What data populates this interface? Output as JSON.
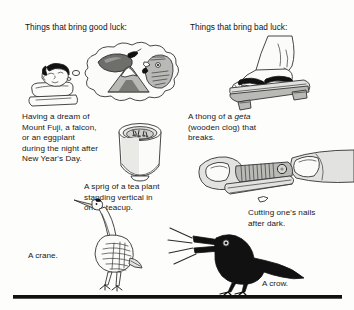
{
  "page": {
    "width": 354,
    "height": 310,
    "background": "#fdfdfc",
    "ink_color": "#181818"
  },
  "columns": {
    "left_heading": "Things that bring good luck:",
    "right_heading": "Things that bring bad luck:"
  },
  "captions": {
    "dream": "Having a dream of\nMount Fuji, a falcon,\nor an eggplant\nduring the night after\nNew Year's Day.",
    "geta_before": "A thong of a ",
    "geta_italic": "geta",
    "geta_after": "\n(wooden clog) that\nbreaks.",
    "tea": "A sprig of a tea plant\nstanding vertical in\none's teacup.",
    "nails": "Cutting one's nails\nafter dark.",
    "crane": "A crane.",
    "crow": "A crow."
  },
  "illustrations": [
    {
      "name": "sleeping-person-dreaming",
      "column": "left",
      "depicts": "person asleep on a pillow with a thought bubble"
    },
    {
      "name": "dream-bubble-eggplant",
      "column": "left",
      "depicts": "eggplant inside dream bubble"
    },
    {
      "name": "dream-bubble-mount-fuji",
      "column": "left",
      "depicts": "Mount Fuji inside dream bubble"
    },
    {
      "name": "dream-bubble-falcon",
      "column": "left",
      "depicts": "falcon head inside dream bubble"
    },
    {
      "name": "teacup-with-tea-sprig",
      "column": "left",
      "depicts": "teacup seen from above with floating tea leaves"
    },
    {
      "name": "crane-bird",
      "column": "left",
      "depicts": "standing crane"
    },
    {
      "name": "foot-in-geta-sandal",
      "column": "right",
      "depicts": "bare foot wearing a wooden geta clog"
    },
    {
      "name": "nail-clipper-cutting-nail",
      "column": "right",
      "depicts": "clipper trimming a fingernail"
    },
    {
      "name": "crow-bird",
      "column": "right",
      "depicts": "black crow cawing"
    }
  ],
  "divider": {
    "name": "bottom-rule",
    "color": "#111111"
  }
}
